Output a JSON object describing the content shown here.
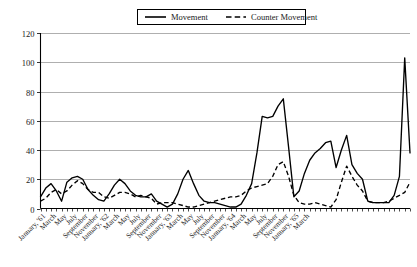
{
  "chart_data": {
    "type": "line",
    "title": "",
    "xlabel": "",
    "ylabel": "",
    "ylim": [
      0,
      120
    ],
    "yticks": [
      0,
      20,
      40,
      60,
      80,
      100,
      120
    ],
    "grid": true,
    "legend_position": "top-center",
    "legend": [
      "Movement",
      "Counter Movement"
    ],
    "x": [
      "January, '61",
      "February, '61",
      "March, '61",
      "April, '61",
      "May, '61",
      "June, '61",
      "July, '61",
      "August, '61",
      "September, '61",
      "October, '61",
      "November, '61",
      "December, '61",
      "January, '62",
      "February, '62",
      "March, '62",
      "April, '62",
      "May, '62",
      "June, '62",
      "July, '62",
      "August, '62",
      "September, '62",
      "October, '62",
      "November, '62",
      "December, '62",
      "January, '63",
      "February, '63",
      "March, '63",
      "April, '63",
      "May, '63",
      "June, '63",
      "July, '63",
      "August, '63",
      "September, '63",
      "October, '63",
      "November, '63",
      "December, '63",
      "January, '64",
      "February, '64",
      "March, '64",
      "April, '64",
      "May, '64",
      "June, '64",
      "July, '64",
      "August, '64",
      "September, '64",
      "October, '64",
      "November, '64",
      "December, '64",
      "January, '65",
      "February, '65",
      "March, '65",
      "April, '65"
    ],
    "xtick_labels": [
      "January, '61",
      "March",
      "May",
      "July",
      "September",
      "November",
      "January, '62",
      "March",
      "May",
      "July",
      "September",
      "November",
      "January, '63",
      "March",
      "May",
      "July",
      "September",
      "November",
      "January, '64",
      "March",
      "May",
      "July",
      "September",
      "November",
      "January, '65",
      "March"
    ],
    "xtick_indices": [
      0,
      2,
      4,
      6,
      8,
      10,
      12,
      14,
      16,
      18,
      20,
      22,
      24,
      26,
      28,
      30,
      32,
      34,
      36,
      38,
      40,
      42,
      44,
      46,
      48,
      50
    ],
    "series": [
      {
        "name": "Movement",
        "style": "solid",
        "color": "#000000",
        "values": [
          8,
          14,
          17,
          12,
          5,
          18,
          21,
          22,
          20,
          13,
          9,
          6,
          5,
          10,
          16,
          20,
          17,
          12,
          9,
          8,
          8,
          10,
          5,
          3,
          1,
          3,
          10,
          20,
          26,
          17,
          9,
          5,
          4,
          4,
          3,
          2,
          1,
          1,
          3,
          9,
          17,
          38,
          63,
          62,
          63,
          70,
          75,
          42,
          8,
          9,
          12,
          25
        ]
      },
      {
        "name": "Counter Movement",
        "style": "dashed",
        "color": "#000000",
        "values": [
          5,
          7,
          11,
          13,
          10,
          12,
          16,
          19,
          17,
          13,
          11,
          11,
          8,
          7,
          9,
          11,
          11,
          10,
          8,
          9,
          8,
          7,
          3,
          4,
          4,
          4,
          3,
          2,
          1,
          1,
          2,
          3,
          4,
          5,
          6,
          7,
          8,
          8,
          9,
          12,
          14,
          15,
          16,
          17,
          22,
          30,
          32,
          22,
          9,
          4,
          3,
          3
        ]
      }
    ],
    "series_extra": {
      "note": "second half of timeline",
      "x2": [
        "January, '64",
        "February, '64",
        "March, '64",
        "April, '64",
        "May, '64",
        "June, '64",
        "July, '64",
        "August, '64",
        "September, '64",
        "October, '64",
        "November, '64",
        "December, '64",
        "January, '65",
        "February, '65",
        "March, '65",
        "April, '65"
      ]
    }
  },
  "full_series": {
    "movement": [
      8,
      14,
      17,
      12,
      5,
      18,
      21,
      22,
      20,
      13,
      9,
      6,
      5,
      10,
      16,
      20,
      17,
      12,
      9,
      8,
      8,
      10,
      5,
      3,
      1,
      3,
      10,
      20,
      26,
      17,
      9,
      5,
      4,
      4,
      3,
      2,
      1,
      1,
      3,
      9,
      17,
      38,
      63,
      62,
      63,
      70,
      75,
      42,
      8,
      12,
      24,
      33,
      38,
      41,
      45,
      46,
      28,
      40,
      50,
      30,
      24,
      20,
      5,
      4,
      4,
      4,
      4,
      9,
      22,
      103,
      38
    ],
    "counter": [
      5,
      7,
      11,
      13,
      10,
      12,
      16,
      19,
      17,
      13,
      11,
      11,
      8,
      7,
      9,
      11,
      11,
      10,
      8,
      9,
      8,
      7,
      3,
      4,
      4,
      4,
      3,
      2,
      1,
      1,
      2,
      3,
      4,
      5,
      6,
      7,
      8,
      8,
      9,
      12,
      14,
      15,
      16,
      17,
      22,
      30,
      32,
      22,
      9,
      4,
      3,
      3,
      4,
      3,
      2,
      1,
      6,
      18,
      29,
      22,
      16,
      12,
      5,
      4,
      4,
      4,
      5,
      7,
      9,
      11,
      18
    ]
  },
  "legend": {
    "movement_label": "Movement",
    "counter_label": "Counter Movement"
  },
  "axis": {
    "y_labels": [
      "0",
      "20",
      "40",
      "60",
      "80",
      "100",
      "120"
    ],
    "x_labels": [
      "January, '61",
      "March",
      "May",
      "July",
      "September",
      "November",
      "January, '62",
      "March",
      "May",
      "July",
      "September",
      "November",
      "January, '63",
      "March",
      "May",
      "July",
      "September",
      "November",
      "January, '64",
      "March",
      "May",
      "July",
      "September",
      "November",
      "January, '65",
      "March"
    ]
  },
  "colors": {
    "line": "#000000",
    "grid": "#9a9a9a",
    "axis": "#000000",
    "background": "#ffffff"
  }
}
